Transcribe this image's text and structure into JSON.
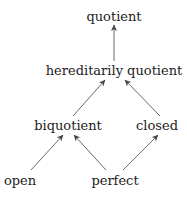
{
  "diagram": {
    "nodes": {
      "quotient": {
        "label": "quotient"
      },
      "hereditarily_quotient": {
        "label": "hereditarily quotient"
      },
      "biquotient": {
        "label": "biquotient"
      },
      "closed": {
        "label": "closed"
      },
      "open": {
        "label": "open"
      },
      "perfect": {
        "label": "perfect"
      }
    },
    "edges": [
      {
        "from": "hereditarily quotient",
        "to": "quotient"
      },
      {
        "from": "biquotient",
        "to": "hereditarily quotient"
      },
      {
        "from": "closed",
        "to": "hereditarily quotient"
      },
      {
        "from": "open",
        "to": "biquotient"
      },
      {
        "from": "perfect",
        "to": "biquotient"
      },
      {
        "from": "perfect",
        "to": "closed"
      }
    ],
    "colors": {
      "edge": "#444444",
      "text": "#222222",
      "background": "#ffffff"
    }
  }
}
